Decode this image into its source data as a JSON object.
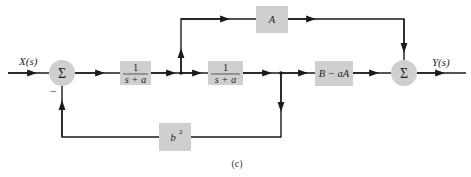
{
  "diagram": {
    "caption": "(c)",
    "input_label": "X(s)",
    "output_label": "Y(s)",
    "summer_symbol": "Σ",
    "minus_sign": "−",
    "blocks": {
      "first_integrator": {
        "numerator": "1",
        "denominator": "s + a"
      },
      "second_integrator": {
        "numerator": "1",
        "denominator": "s + a"
      },
      "feedforward": {
        "label": "A"
      },
      "output_gain": {
        "label": "B − aA"
      },
      "feedback": {
        "label": "b",
        "superscript": "2"
      }
    },
    "colors": {
      "block_fill": "#cfcfcf",
      "line": "#1a1a1a",
      "background": "#ffffff"
    }
  }
}
